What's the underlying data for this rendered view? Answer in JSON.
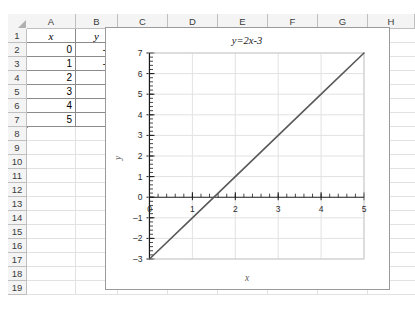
{
  "spreadsheet": {
    "column_headers": [
      "A",
      "B",
      "C",
      "D",
      "E",
      "F",
      "G",
      "H"
    ],
    "row_headers": [
      "1",
      "2",
      "3",
      "4",
      "5",
      "6",
      "7",
      "8",
      "9",
      "10",
      "11",
      "12",
      "13",
      "14",
      "15",
      "16",
      "17",
      "18",
      "19"
    ],
    "select_all_icon": "select-all-corner-icon",
    "table": {
      "headers": [
        "x",
        "y"
      ],
      "rows": [
        [
          "0",
          "–3"
        ],
        [
          "1",
          "–1"
        ],
        [
          "2",
          "1"
        ],
        [
          "3",
          "3"
        ],
        [
          "4",
          "5"
        ],
        [
          "5",
          "7"
        ]
      ]
    }
  },
  "chart_data": {
    "type": "line",
    "title": "y=2x-3",
    "xlabel": "x",
    "ylabel": "y",
    "xlim": [
      0,
      5
    ],
    "ylim": [
      -3,
      7
    ],
    "x_ticks": [
      "0",
      "1",
      "2",
      "3",
      "4",
      "5"
    ],
    "y_ticks": [
      "7",
      "6",
      "5",
      "4",
      "3",
      "2",
      "1",
      "0",
      "-1",
      "-2",
      "-3"
    ],
    "x_minor_step": 0.2,
    "y_minor_step": 0.2,
    "grid": "horizontal-and-vertical",
    "legend": "none",
    "series": [
      {
        "name": "y=2x-3",
        "color": "#595959",
        "x": [
          0,
          1,
          2,
          3,
          4,
          5
        ],
        "values": [
          -3,
          -1,
          1,
          3,
          5,
          7
        ]
      }
    ]
  },
  "colors": {
    "grid_line": "#e2e2e2",
    "header_fill": "#f4f4f4",
    "table_border": "#8a8a8a",
    "chart_border": "#9a9a9a",
    "series_line": "#595959",
    "axis_line": "#1a1a1a"
  }
}
